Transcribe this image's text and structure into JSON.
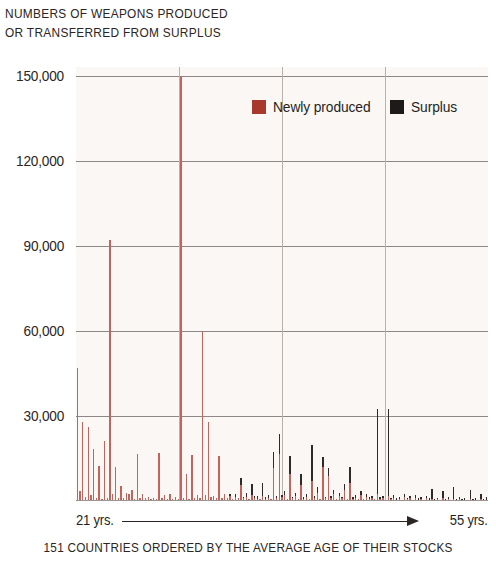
{
  "title": {
    "line1": "NUMBERS OF WEAPONS PRODUCED",
    "line2": "OR TRANSFERRED FROM SURPLUS"
  },
  "legend": {
    "items": [
      {
        "label": "Newly produced",
        "color": "#a8372c",
        "key": "newly_produced"
      },
      {
        "label": "Surplus",
        "color": "#1d1a19",
        "key": "surplus"
      }
    ]
  },
  "x_axis": {
    "left_label": "21 yrs.",
    "right_label": "55 yrs.",
    "caption": "151 COUNTRIES ORDERED BY THE AVERAGE AGE OF THEIR STOCKS"
  },
  "chart_data": {
    "type": "bar",
    "stacked": true,
    "title": "NUMBERS OF WEAPONS PRODUCED OR TRANSFERRED FROM SURPLUS",
    "xlabel": "151 COUNTRIES ORDERED BY THE AVERAGE AGE OF THEIR STOCKS",
    "ylabel": "",
    "ylim": [
      0,
      153000
    ],
    "xlim": [
      0,
      151
    ],
    "grid": true,
    "gridlines_y": [
      30000,
      60000,
      90000,
      120000,
      150000
    ],
    "yticks": [
      30000,
      60000,
      90000,
      120000,
      150000
    ],
    "ytick_labels": [
      "30,000",
      "60,000",
      "90,000",
      "120,000",
      "150,000"
    ],
    "xtick_labels": [
      "21 yrs.",
      "55 yrs."
    ],
    "legend_position": "top-right",
    "n_categories": 151,
    "series": [
      {
        "name": "Newly produced",
        "color": "#c2645c",
        "values": [
          47000,
          3500,
          28000,
          1500,
          26000,
          2000,
          18500,
          900,
          12500,
          800,
          21000,
          1200,
          92000,
          2500,
          12000,
          1000,
          5200,
          900,
          3000,
          2400,
          3800,
          700,
          16500,
          1100,
          2600,
          900,
          1400,
          800,
          1100,
          600,
          16800,
          900,
          2200,
          700,
          2400,
          800,
          1500,
          600,
          150000,
          1200,
          9500,
          800,
          16200,
          1100,
          2000,
          900,
          60000,
          2100,
          28000,
          1400,
          1700,
          900,
          16000,
          1200,
          2500,
          1000,
          1800,
          800,
          1500,
          900,
          5800,
          1000,
          1300,
          700,
          2200,
          900,
          800,
          600,
          1800,
          700,
          1200,
          600,
          11500,
          900,
          16500,
          1300,
          2000,
          800,
          9500,
          900,
          1800,
          700,
          5500,
          800,
          1400,
          600,
          7200,
          900,
          3000,
          700,
          12000,
          900,
          8800,
          1100,
          2500,
          800,
          1600,
          900,
          3800,
          700,
          6500,
          800,
          1200,
          600,
          2000,
          700,
          1400,
          800,
          1000,
          600,
          2600,
          700,
          900,
          500,
          1800,
          600,
          1100,
          500,
          800,
          400,
          1500,
          600,
          900,
          400,
          1200,
          500,
          700,
          400,
          1000,
          500,
          800,
          400,
          600,
          350,
          900,
          400,
          700,
          350,
          600,
          300,
          800,
          350,
          500,
          300,
          700,
          350,
          500,
          300,
          600,
          300,
          400
        ]
      },
      {
        "name": "Surplus",
        "color": "#2e2a29",
        "values": [
          0,
          0,
          0,
          0,
          0,
          0,
          0,
          0,
          0,
          0,
          0,
          0,
          0,
          0,
          0,
          0,
          0,
          0,
          0,
          0,
          0,
          0,
          0,
          0,
          0,
          0,
          0,
          0,
          0,
          0,
          0,
          0,
          0,
          0,
          0,
          0,
          0,
          0,
          0,
          0,
          0,
          0,
          0,
          0,
          0,
          0,
          0,
          0,
          0,
          0,
          0,
          0,
          0,
          0,
          0,
          0,
          600,
          0,
          800,
          0,
          2400,
          500,
          1500,
          0,
          3800,
          700,
          1100,
          0,
          4500,
          600,
          900,
          0,
          5800,
          700,
          7200,
          900,
          1400,
          0,
          6500,
          600,
          1200,
          0,
          4200,
          500,
          900,
          0,
          12500,
          700,
          2000,
          0,
          3500,
          600,
          2800,
          700,
          1500,
          0,
          1100,
          500,
          2200,
          0,
          5500,
          600,
          900,
          0,
          1400,
          0,
          1000,
          500,
          700,
          0,
          29800,
          600,
          800,
          0,
          30500,
          500,
          1000,
          400,
          600,
          0,
          900,
          400,
          700,
          0,
          1100,
          400,
          600,
          0,
          800,
          400,
          3500,
          400,
          500,
          0,
          2800,
          400,
          600,
          0,
          4500,
          300,
          700,
          300,
          400,
          0,
          3200,
          400,
          600,
          0,
          2000,
          300,
          900
        ]
      }
    ]
  }
}
